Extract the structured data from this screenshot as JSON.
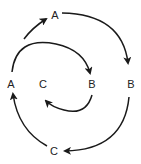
{
  "diagram": {
    "type": "cycle",
    "outer_cycle": {
      "nodes": [
        {
          "id": "A_top",
          "label": "A"
        },
        {
          "id": "B_right",
          "label": "B"
        },
        {
          "id": "C_bottom",
          "label": "C"
        },
        {
          "id": "A_left",
          "label": "A"
        }
      ]
    },
    "inner_cycle": {
      "nodes": [
        {
          "id": "B_inner",
          "label": "B"
        },
        {
          "id": "C_inner",
          "label": "C"
        }
      ]
    },
    "edges": [
      {
        "from": "A_left",
        "to": "A_top"
      },
      {
        "from": "A_top",
        "to": "B_right"
      },
      {
        "from": "B_right",
        "to": "C_bottom"
      },
      {
        "from": "C_bottom",
        "to": "A_left"
      },
      {
        "from": "A_left",
        "to": "B_inner"
      },
      {
        "from": "B_inner",
        "to": "C_inner"
      }
    ],
    "stroke_color": "#1a1a1a"
  }
}
